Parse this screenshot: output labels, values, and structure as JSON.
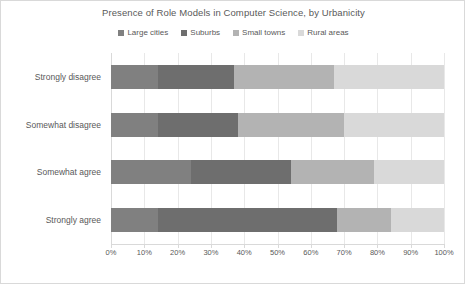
{
  "chart_data": {
    "type": "bar",
    "orientation": "horizontal",
    "stacked": true,
    "stack_mode": "percent",
    "title": "Presence of Role Models in Computer Science, by Urbanicity",
    "xlabel": "",
    "ylabel": "",
    "xlim": [
      0,
      100
    ],
    "xtick_labels": [
      "0%",
      "10%",
      "20%",
      "30%",
      "40%",
      "50%",
      "60%",
      "70%",
      "80%",
      "90%",
      "100%"
    ],
    "xticks": [
      0,
      10,
      20,
      30,
      40,
      50,
      60,
      70,
      80,
      90,
      100
    ],
    "grid": true,
    "grid_axis": "x",
    "legend_position": "top",
    "categories": [
      "Strongly disagree",
      "Somewhat disagree",
      "Somewhat agree",
      "Strongly agree"
    ],
    "series": [
      {
        "name": "Large cities",
        "color": "#808080",
        "values": [
          14,
          14,
          24,
          14
        ]
      },
      {
        "name": "Suburbs",
        "color": "#6e6e6e",
        "values": [
          23,
          24,
          30,
          54
        ]
      },
      {
        "name": "Small towns",
        "color": "#b3b3b3",
        "values": [
          30,
          32,
          25,
          16
        ]
      },
      {
        "name": "Rural areas",
        "color": "#d9d9d9",
        "values": [
          33,
          30,
          21,
          16
        ]
      }
    ]
  },
  "legend": {
    "items": [
      {
        "label": "Large cities"
      },
      {
        "label": "Suburbs"
      },
      {
        "label": "Small towns"
      },
      {
        "label": "Rural areas"
      }
    ]
  }
}
